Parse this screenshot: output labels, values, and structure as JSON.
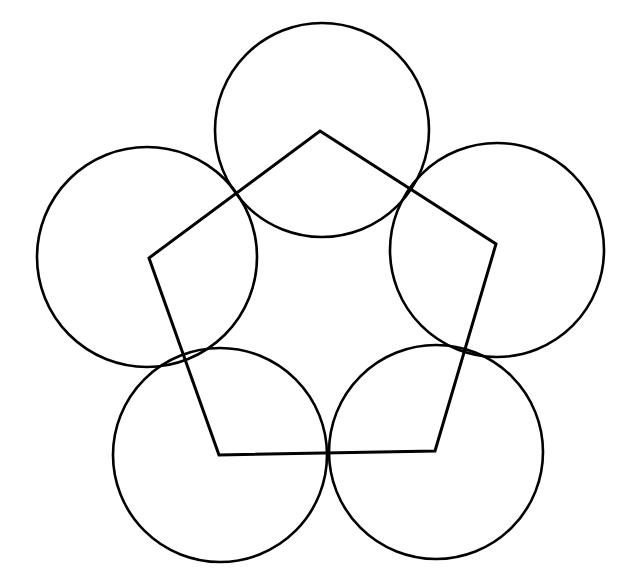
{
  "diagram": {
    "stroke_color": "#000000",
    "background": "#ffffff",
    "pentagon": {
      "vertices": [
        [
          320,
          131
        ],
        [
          496,
          244
        ],
        [
          435,
          451
        ],
        [
          219,
          455
        ],
        [
          149,
          258
        ]
      ]
    },
    "circles": [
      {
        "cx": 322,
        "cy": 130,
        "r": 107
      },
      {
        "cx": 497,
        "cy": 250,
        "r": 107
      },
      {
        "cx": 436,
        "cy": 452,
        "r": 107
      },
      {
        "cx": 220,
        "cy": 455,
        "r": 107
      },
      {
        "cx": 147,
        "cy": 257,
        "r": 110
      }
    ]
  }
}
